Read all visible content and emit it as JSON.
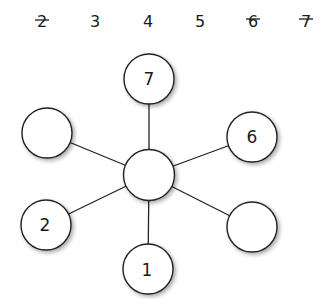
{
  "available_numbers": [
    {
      "value": "2",
      "crossed": true
    },
    {
      "value": "3",
      "crossed": false
    },
    {
      "value": "4",
      "crossed": false
    },
    {
      "value": "5",
      "crossed": false
    },
    {
      "value": "6",
      "crossed": true
    },
    {
      "value": "7",
      "crossed": true
    }
  ],
  "nodes": {
    "center": {
      "label": ""
    },
    "top": {
      "label": "7"
    },
    "upper_left": {
      "label": ""
    },
    "upper_right": {
      "label": "6"
    },
    "lower_left": {
      "label": "2"
    },
    "lower_right": {
      "label": ""
    },
    "bottom": {
      "label": "1"
    }
  },
  "colors": {
    "stroke": "#222222",
    "fill": "#ffffff",
    "shadow": "#9a9a9a"
  }
}
